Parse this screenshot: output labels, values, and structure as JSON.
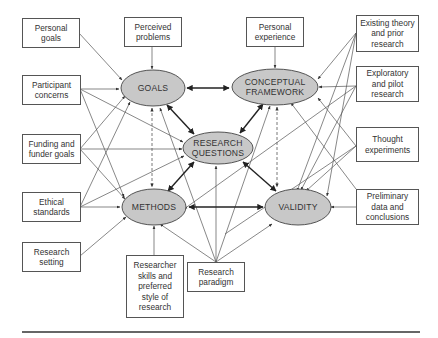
{
  "diagram": {
    "type": "interactive model of research design",
    "core_components": {
      "goals": "GOALS",
      "conceptual_framework": "CONCEPTUAL FRAMEWORK",
      "research_questions": "RESEARCH QUESTIONS",
      "methods": "METHODS",
      "validity": "VALIDITY"
    },
    "influences": {
      "personal_goals": "Personal goals",
      "perceived_problems": "Perceived problems",
      "personal_experience": "Personal experience",
      "existing_theory": "Existing theory and prior research",
      "participant_concerns": "Participant concerns",
      "exploratory_pilot": "Exploratory and pilot research",
      "funding": "Funding and funder goals",
      "thought_experiments": "Thought experiments",
      "ethical_standards": "Ethical standards",
      "preliminary_data": "Preliminary data and conclusions",
      "research_setting": "Research setting",
      "researcher_skills": "Researcher skills and preferred style of research",
      "research_paradigm": "Research paradigm"
    },
    "colors": {
      "ellipse_fill": "#c8c8c8",
      "stroke": "#444444",
      "box_border": "#555555"
    }
  }
}
